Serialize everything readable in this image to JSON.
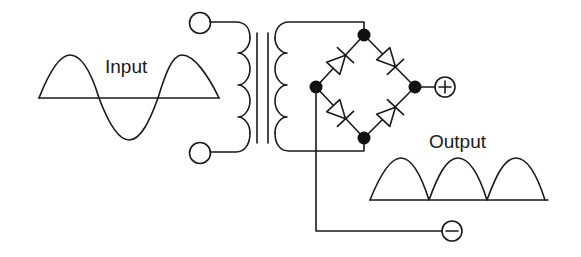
{
  "diagram": {
    "labels": {
      "input": "Input",
      "output": "Output",
      "plus": "+",
      "minus": "−"
    },
    "components": {
      "transformer": "transformer",
      "bridge": "diode-bridge",
      "diodes": 4,
      "nodes": 4
    },
    "colors": {
      "stroke": "#1a1a1a",
      "background": "#ffffff"
    }
  }
}
